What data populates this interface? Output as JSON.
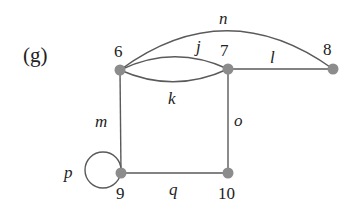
{
  "panel_label": "(g)",
  "colors": {
    "node": "#8c8c8c",
    "edge": "#5a5a5a",
    "text": "#222222"
  },
  "vertices": [
    {
      "id": "6",
      "label": "6",
      "x": 120,
      "y": 70
    },
    {
      "id": "7",
      "label": "7",
      "x": 228,
      "y": 69
    },
    {
      "id": "8",
      "label": "8",
      "x": 333,
      "y": 69
    },
    {
      "id": "9",
      "label": "9",
      "x": 121,
      "y": 173
    },
    {
      "id": "10",
      "label": "10",
      "x": 228,
      "y": 173
    }
  ],
  "edges": [
    {
      "id": "j",
      "label": "j",
      "from": "6",
      "to": "7",
      "shape": "arc-up"
    },
    {
      "id": "k",
      "label": "k",
      "from": "6",
      "to": "7",
      "shape": "arc-down"
    },
    {
      "id": "l",
      "label": "l",
      "from": "7",
      "to": "8",
      "shape": "line"
    },
    {
      "id": "m",
      "label": "m",
      "from": "6",
      "to": "9",
      "shape": "line"
    },
    {
      "id": "n",
      "label": "n",
      "from": "6",
      "to": "8",
      "shape": "arc-up"
    },
    {
      "id": "o",
      "label": "o",
      "from": "7",
      "to": "10",
      "shape": "line"
    },
    {
      "id": "p",
      "label": "p",
      "from": "9",
      "to": "9",
      "shape": "loop"
    },
    {
      "id": "q",
      "label": "q",
      "from": "9",
      "to": "10",
      "shape": "line"
    }
  ]
}
